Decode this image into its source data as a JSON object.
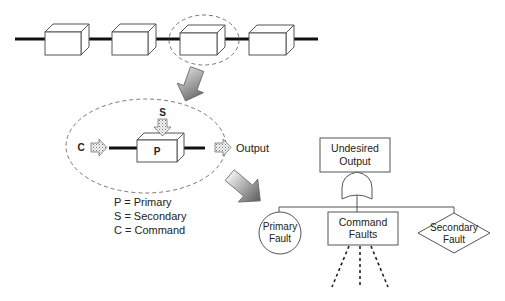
{
  "diagram": {
    "top_chain": {
      "component_count": 4,
      "highlighted_index": 3
    },
    "component_model": {
      "primary_label": "P",
      "secondary_label": "S",
      "command_label": "C",
      "output_label": "Output"
    },
    "legend": {
      "items": [
        {
          "text": "P = Primary"
        },
        {
          "text": "S = Secondary"
        },
        {
          "text": "C = Command"
        }
      ]
    },
    "fault_tree": {
      "top_event": {
        "line1": "Undesired",
        "line2": "Output"
      },
      "gate": "OR",
      "children": [
        {
          "shape": "circle",
          "line1": "Primary",
          "line2": "Fault"
        },
        {
          "shape": "rectangle",
          "line1": "Command",
          "line2": "Faults"
        },
        {
          "shape": "diamond",
          "line1": "Secondary",
          "line2": "Fault"
        }
      ]
    },
    "colors": {
      "line": "#111111",
      "outline": "#555555",
      "dashed": "#777777",
      "arrow_dark": "#555555",
      "arrow_light": "#e6e6e6",
      "stipple": "#888888"
    }
  }
}
